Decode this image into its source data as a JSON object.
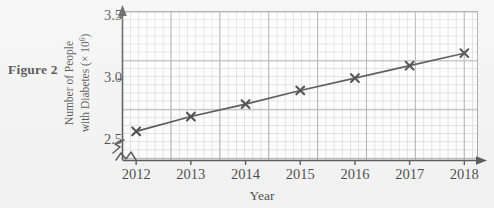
{
  "figure": {
    "caption": "Figure 2"
  },
  "chart_data": {
    "type": "line",
    "title": "",
    "subtitle": "",
    "xlabel": "Year",
    "ylabel_line1": "Number of People",
    "ylabel_line2": "with Diabetes (× 10",
    "ylabel_exponent": "6",
    "ylabel_line2_close": ")",
    "categories": [
      2012,
      2013,
      2014,
      2015,
      2016,
      2017,
      2018
    ],
    "x": [
      2012,
      2013,
      2014,
      2015,
      2016,
      2017,
      2018
    ],
    "values": [
      2.58,
      2.7,
      2.8,
      2.91,
      3.01,
      3.11,
      3.21
    ],
    "series": [
      {
        "name": "Number of People with Diabetes",
        "values": [
          2.58,
          2.7,
          2.8,
          2.91,
          3.01,
          3.11,
          3.21
        ]
      }
    ],
    "xtick_labels": [
      "2012",
      "2013",
      "2014",
      "2015",
      "2016",
      "2017",
      "2018"
    ],
    "ytick_labels": [
      "2.5",
      "3.0",
      "3.5"
    ],
    "ytick_values": [
      2.5,
      3.0,
      3.5
    ],
    "ylim": [
      2.35,
      3.55
    ],
    "xlim": [
      2011.75,
      2018.25
    ],
    "grid": true,
    "minor_grid": true,
    "legend": false,
    "legend_position": "none",
    "marker": "x",
    "axis_break_y": true,
    "annotations": [],
    "colors": {
      "line": "#1c1c1c",
      "marker": "#0f0f0f",
      "major_grid": "#9a9a9a",
      "minor_grid": "#d8d8d8",
      "axis": "#262626",
      "plot_background": "#ffffff",
      "page_background": "#f2f2f2",
      "text": "#111111"
    }
  }
}
